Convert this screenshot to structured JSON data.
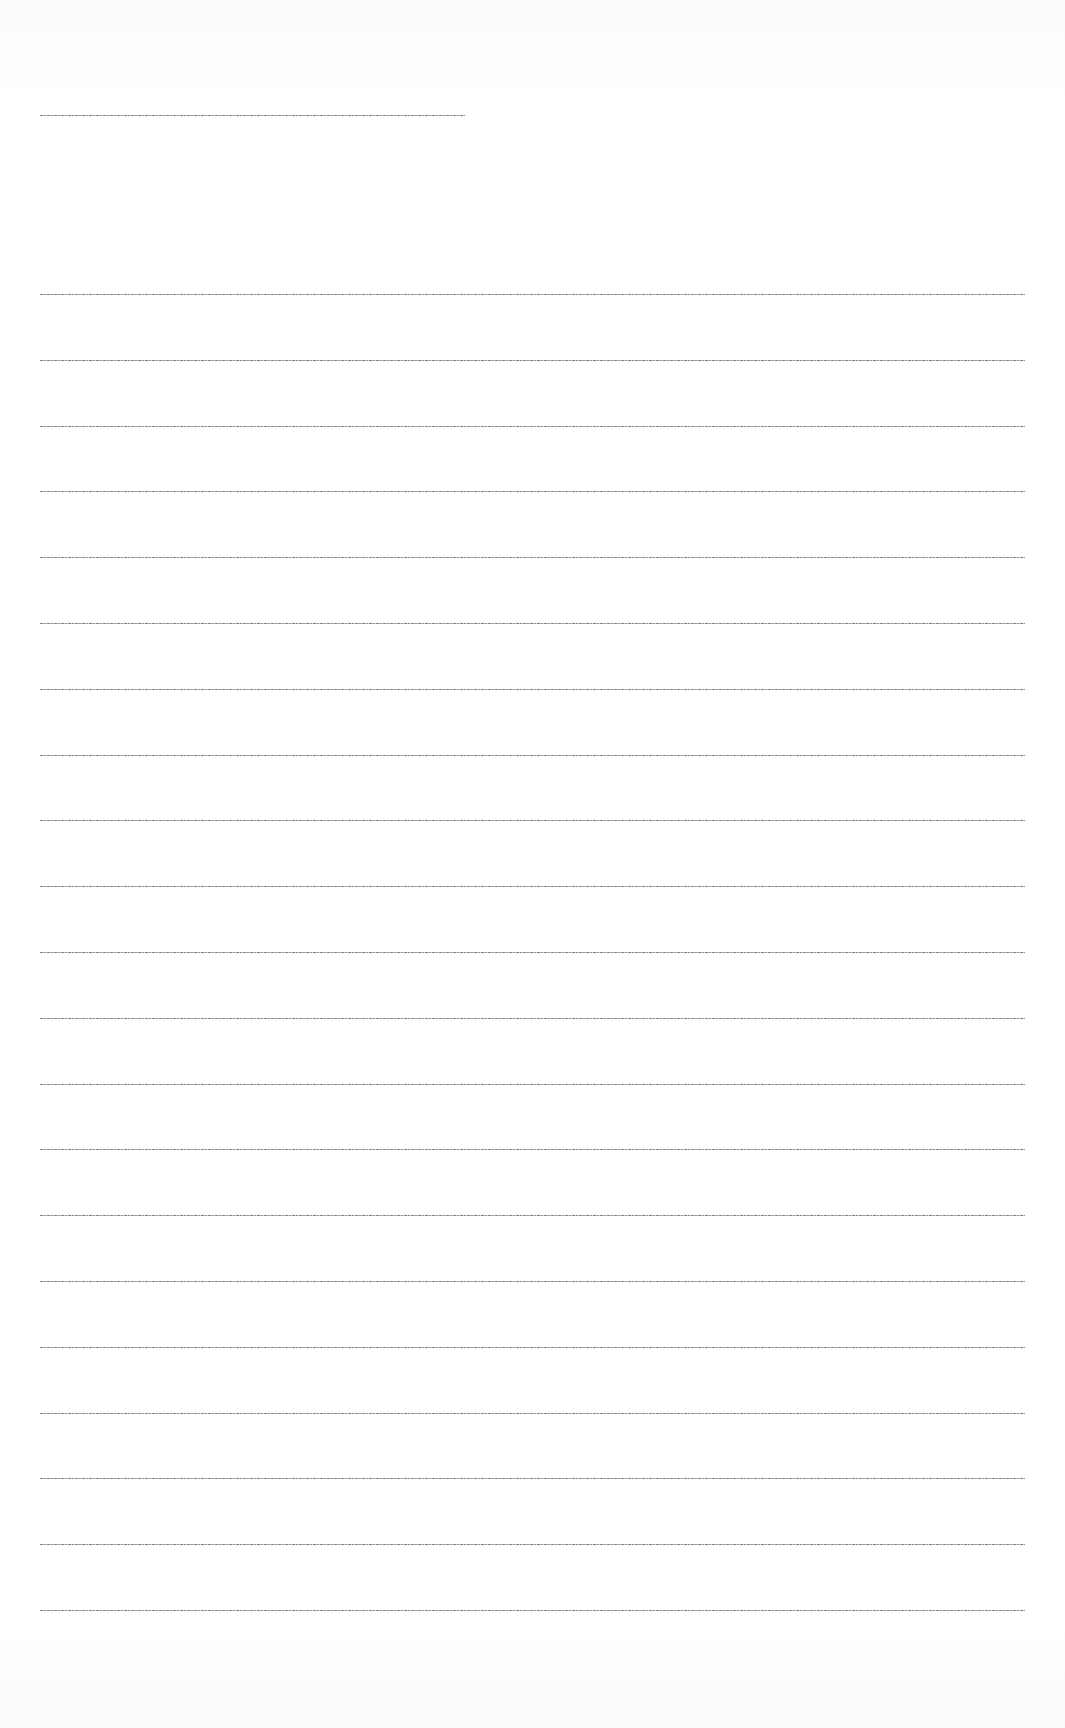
{
  "page": {
    "type": "ruled-sheet",
    "background_color": "#ffffff",
    "line_color": "#7a7a7a"
  },
  "heading_rule": {
    "top": 115,
    "left": 40,
    "width": 425
  },
  "ruled_lines": {
    "count": 21,
    "first_top": 294,
    "spacing": 65.8,
    "left": 40,
    "width": 985
  },
  "text_content": []
}
